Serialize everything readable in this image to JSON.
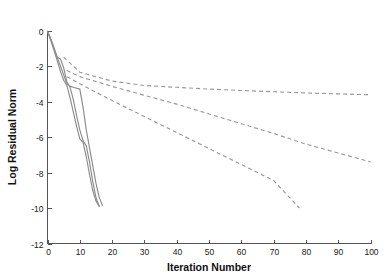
{
  "chart_data": {
    "type": "line",
    "title": "",
    "xlabel": "Iteration Number",
    "ylabel": "Log Residual Norm",
    "xlim": [
      0,
      100
    ],
    "ylim": [
      -12,
      0
    ],
    "xticks": [
      0,
      10,
      20,
      30,
      40,
      50,
      60,
      70,
      80,
      90,
      100
    ],
    "xticklabels": [
      "0",
      "10",
      "20",
      "30",
      "40",
      "50",
      "60",
      "70",
      "80",
      "90",
      "100"
    ],
    "yticks": [
      0,
      -2,
      -4,
      -6,
      -8,
      -10,
      -12
    ],
    "yticklabels": [
      "0",
      "-2",
      "-4",
      "-6",
      "-8",
      "-10",
      "-12"
    ],
    "grid": false,
    "legend": null,
    "line_color": "#8b8b8b",
    "dashed_color": "#9a9a9a",
    "series": [
      {
        "name": "solid-curve-1",
        "style": "solid",
        "x": [
          0,
          1,
          2,
          3,
          4,
          5,
          6,
          7,
          8,
          9,
          10,
          11,
          12,
          13,
          14,
          15,
          16,
          17
        ],
        "y": [
          -0.05,
          -0.45,
          -0.95,
          -1.5,
          -2.0,
          -2.5,
          -3.0,
          -3.15,
          -3.2,
          -3.25,
          -3.3,
          -4.3,
          -5.6,
          -6.6,
          -7.6,
          -8.6,
          -9.4,
          -9.85
        ]
      },
      {
        "name": "solid-curve-2",
        "style": "solid",
        "x": [
          0,
          1,
          2,
          3,
          4,
          5,
          6,
          7,
          8,
          9,
          10,
          11,
          12,
          13,
          14,
          15,
          16
        ],
        "y": [
          -0.05,
          -0.5,
          -1.05,
          -1.5,
          -1.6,
          -2.1,
          -2.9,
          -3.2,
          -3.9,
          -4.8,
          -5.6,
          -6.2,
          -6.5,
          -7.4,
          -8.5,
          -9.4,
          -9.9
        ]
      },
      {
        "name": "solid-curve-3",
        "style": "solid",
        "x": [
          0,
          1,
          2,
          3,
          4,
          5,
          6,
          7,
          8,
          9,
          10,
          11,
          12,
          13,
          14,
          15,
          16
        ],
        "y": [
          -0.05,
          -0.55,
          -1.1,
          -1.7,
          -2.3,
          -2.8,
          -3.1,
          -3.8,
          -4.6,
          -5.4,
          -6.1,
          -6.3,
          -7.1,
          -8.1,
          -9.0,
          -9.6,
          -9.9
        ]
      },
      {
        "name": "dashed-asymptote-1",
        "style": "dashed",
        "x": [
          5,
          10,
          20,
          30,
          40,
          50,
          60,
          70,
          80,
          90,
          100
        ],
        "y": [
          -1.5,
          -2.35,
          -2.85,
          -3.1,
          -3.2,
          -3.3,
          -3.38,
          -3.45,
          -3.52,
          -3.57,
          -3.62
        ]
      },
      {
        "name": "dashed-asymptote-2",
        "style": "dashed",
        "x": [
          6,
          10,
          20,
          30,
          40,
          50,
          60,
          70,
          80,
          90,
          100
        ],
        "y": [
          -2.25,
          -2.6,
          -3.15,
          -3.65,
          -4.15,
          -4.7,
          -5.25,
          -5.8,
          -6.4,
          -6.9,
          -7.4
        ]
      },
      {
        "name": "dashed-asymptote-3",
        "style": "dashed",
        "x": [
          6,
          10,
          20,
          30,
          40,
          50,
          60,
          70,
          78
        ],
        "y": [
          -2.6,
          -3.0,
          -3.95,
          -4.85,
          -5.75,
          -6.65,
          -7.55,
          -8.45,
          -10.0
        ]
      }
    ]
  },
  "axes": {
    "x_title": "Iteration Number",
    "y_title": "Log Residual Norm"
  }
}
